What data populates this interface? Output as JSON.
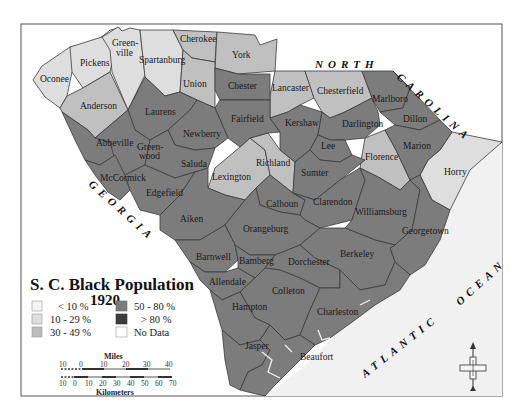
{
  "map": {
    "title_line1": "S. C. Black Population",
    "title_line2": "1920",
    "colors": {
      "lt10": "#f4f4f4",
      "c10_29": "#dedede",
      "c30_49": "#c0c0c0",
      "c50_80": "#7c7c7c",
      "gt80": "#3c3c3c",
      "nodata": "#ffffff",
      "ocean": "#f1f1f1",
      "border": "#3a3a3a"
    },
    "legend": [
      {
        "label": "< 10 %",
        "key": "lt10"
      },
      {
        "label": "10 - 29 %",
        "key": "c10_29"
      },
      {
        "label": "30 - 49 %",
        "key": "c30_49"
      },
      {
        "label": "50 - 80 %",
        "key": "c50_80"
      },
      {
        "label": "> 80 %",
        "key": "gt80"
      },
      {
        "label": "No Data",
        "key": "nodata"
      }
    ],
    "water_labels": {
      "north": "NORTH",
      "carolina": "CAROLINA",
      "georgia": "GEORGIA",
      "atlantic": "ATLANTIC",
      "ocean": "OCEAN"
    },
    "scale": {
      "miles_title": "Miles",
      "miles_ticks": [
        "10",
        "0",
        "10",
        "20",
        "30",
        "40"
      ],
      "km_title": "Kilometers",
      "km_ticks": [
        "10",
        "0",
        "10",
        "20",
        "30",
        "40",
        "50",
        "60",
        "70"
      ]
    },
    "compass": "north-arrow",
    "counties": [
      {
        "name": "Oconee",
        "category": "10-29%"
      },
      {
        "name": "Pickens",
        "category": "10-29%"
      },
      {
        "name": "Greenville",
        "label": "Green-\nville",
        "category": "10-29%"
      },
      {
        "name": "Spartanburg",
        "category": "10-29%"
      },
      {
        "name": "Cherokee",
        "category": "30-49%"
      },
      {
        "name": "York",
        "category": "30-49%"
      },
      {
        "name": "Union",
        "category": "30-49%"
      },
      {
        "name": "Anderson",
        "category": "30-49%"
      },
      {
        "name": "Laurens",
        "category": "50-80%"
      },
      {
        "name": "Chester",
        "category": "50-80%"
      },
      {
        "name": "Lancaster",
        "category": "30-49%"
      },
      {
        "name": "Chesterfield",
        "category": "30-49%"
      },
      {
        "name": "Marlboro",
        "category": "50-80%"
      },
      {
        "name": "Dillon",
        "category": "50-80%"
      },
      {
        "name": "Fairfield",
        "category": "50-80%"
      },
      {
        "name": "Kershaw",
        "category": "50-80%"
      },
      {
        "name": "Darlington",
        "category": "50-80%"
      },
      {
        "name": "Marion",
        "category": "50-80%"
      },
      {
        "name": "Newberry",
        "category": "50-80%"
      },
      {
        "name": "Abbeville",
        "category": "50-80%"
      },
      {
        "name": "Greenwood",
        "label": "Green-\nwood",
        "category": "50-80%"
      },
      {
        "name": "Saluda",
        "category": "50-80%"
      },
      {
        "name": "Lexington",
        "category": "30-49%"
      },
      {
        "name": "Richland",
        "category": "30-49%"
      },
      {
        "name": "Lee",
        "category": "50-80%"
      },
      {
        "name": "Sumter",
        "category": "50-80%"
      },
      {
        "name": "Florence",
        "category": "30-49%"
      },
      {
        "name": "Horry",
        "category": "10-29%"
      },
      {
        "name": "McCormick",
        "category": "50-80%"
      },
      {
        "name": "Edgefield",
        "category": "50-80%"
      },
      {
        "name": "Calhoun",
        "category": "50-80%"
      },
      {
        "name": "Clarendon",
        "category": "50-80%"
      },
      {
        "name": "Williamsburg",
        "category": "50-80%"
      },
      {
        "name": "Aiken",
        "category": "50-80%"
      },
      {
        "name": "Orangeburg",
        "category": "50-80%"
      },
      {
        "name": "Georgetown",
        "category": "50-80%"
      },
      {
        "name": "Barnwell",
        "category": "50-80%"
      },
      {
        "name": "Bamberg",
        "category": "50-80%"
      },
      {
        "name": "Dorchester",
        "category": "50-80%"
      },
      {
        "name": "Berkeley",
        "category": "50-80%"
      },
      {
        "name": "Allendale",
        "category": "50-80%"
      },
      {
        "name": "Colleton",
        "category": "50-80%"
      },
      {
        "name": "Hampton",
        "category": "50-80%"
      },
      {
        "name": "Charleston",
        "category": "50-80%"
      },
      {
        "name": "Jasper",
        "category": "50-80%"
      },
      {
        "name": "Beaufort",
        "category": "50-80%"
      }
    ]
  }
}
